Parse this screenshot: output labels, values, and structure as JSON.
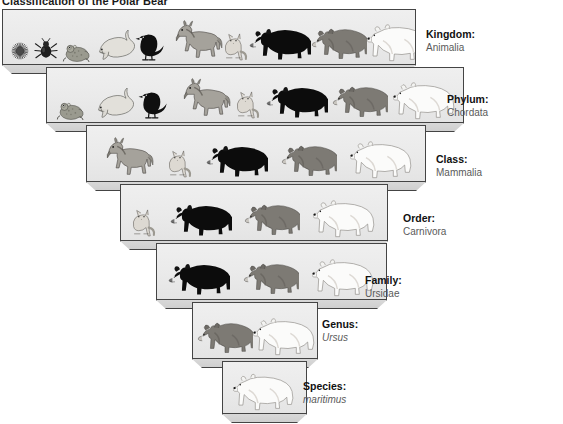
{
  "title": "Classification of the Polar Bear",
  "ranks": [
    {
      "id": "kingdom",
      "name": "Kingdom:",
      "value": "Animalia",
      "italic": false
    },
    {
      "id": "phylum",
      "name": "Phylum:",
      "value": "Chordata",
      "italic": false
    },
    {
      "id": "class",
      "name": "Class:",
      "value": "Mammalia",
      "italic": false
    },
    {
      "id": "order",
      "name": "Order:",
      "value": "Carnivora",
      "italic": false
    },
    {
      "id": "family",
      "name": "Family:",
      "value": "Ursidae",
      "italic": false
    },
    {
      "id": "genus",
      "name": "Genus:",
      "value": "Ursus",
      "italic": true
    },
    {
      "id": "species",
      "name": "Species:",
      "value": "maritimus",
      "italic": true
    }
  ],
  "tiers": [
    {
      "rank": "kingdom",
      "animals": [
        "sea-urchin",
        "beetle",
        "frog",
        "dolphin",
        "crow",
        "horse",
        "cat",
        "black-bear",
        "brown-bear",
        "polar-bear"
      ]
    },
    {
      "rank": "phylum",
      "animals": [
        "frog",
        "dolphin",
        "crow",
        "horse",
        "cat",
        "black-bear",
        "brown-bear",
        "polar-bear"
      ]
    },
    {
      "rank": "class",
      "animals": [
        "horse",
        "cat",
        "black-bear",
        "brown-bear",
        "polar-bear"
      ]
    },
    {
      "rank": "order",
      "animals": [
        "cat",
        "black-bear",
        "brown-bear",
        "polar-bear"
      ]
    },
    {
      "rank": "family",
      "animals": [
        "black-bear",
        "brown-bear",
        "polar-bear"
      ]
    },
    {
      "rank": "genus",
      "animals": [
        "brown-bear",
        "polar-bear"
      ]
    },
    {
      "rank": "species",
      "animals": [
        "polar-bear"
      ]
    }
  ],
  "colors": {
    "shelf_face": "#ecebeb",
    "shelf_base": "#d4d4d4",
    "outline": "#444444",
    "label_name": "#111111",
    "label_value": "#5a5a5a",
    "black_bear": "#0d0d0d",
    "brown_bear": "#8a8a8a",
    "polar_bear": "#fbfbfb",
    "background": "#ffffff"
  }
}
